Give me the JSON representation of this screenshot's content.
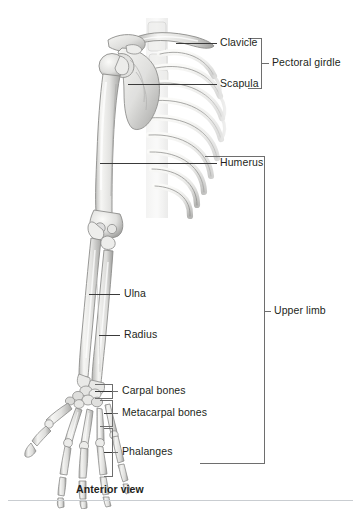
{
  "figure": {
    "title_caption": "Anterior view",
    "view": "anterior",
    "background_color": "#ffffff",
    "bone_fill_light": "#f2f2f0",
    "bone_fill_mid": "#d8d8d6",
    "bone_shade": "#a9a9a7",
    "bone_outline": "#8d8d8b",
    "leader_color": "#3a3a3a",
    "bracket_color": "#6e6e6e",
    "rule_color": "#c9cdd1",
    "text_color": "#231f20"
  },
  "labels": {
    "clavicle": "Clavicle",
    "scapula": "Scapula",
    "pectoral_girdle": "Pectoral girdle",
    "humerus": "Humerus",
    "ulna": "Ulna",
    "radius": "Radius",
    "carpal_bones": "Carpal bones",
    "metacarpal_bones": "Metacarpal bones",
    "phalanges": "Phalanges",
    "upper_limb": "Upper limb",
    "anterior_view": "Anterior view"
  },
  "groups": {
    "pectoral_girdle_members": [
      "Clavicle",
      "Scapula"
    ],
    "upper_limb_members": [
      "Humerus",
      "Ulna",
      "Radius",
      "Carpal bones",
      "Metacarpal bones",
      "Phalanges"
    ]
  }
}
